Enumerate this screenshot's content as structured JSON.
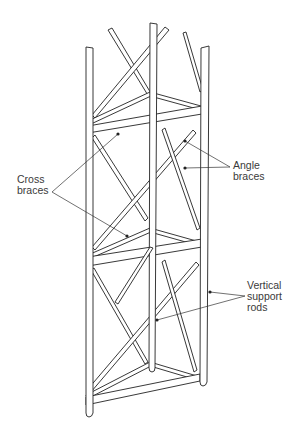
{
  "diagram": {
    "labels": {
      "cross_braces": "Cross\nbraces",
      "angle_braces": "Angle\nbraces",
      "vertical_support_rods": "Vertical\nsupport\nrods"
    },
    "colors": {
      "line": "#222222",
      "label_text": "#3a3a3a",
      "background": "#ffffff"
    }
  }
}
